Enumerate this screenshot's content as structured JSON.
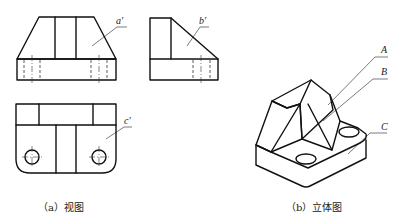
{
  "figure": {
    "views": {
      "caption": "（a）视图",
      "front_view_label": "a′",
      "side_view_label": "b′",
      "top_view_label": "c′"
    },
    "isometric": {
      "caption": "（b）立体图",
      "labels": [
        "A",
        "B",
        "C"
      ]
    }
  }
}
